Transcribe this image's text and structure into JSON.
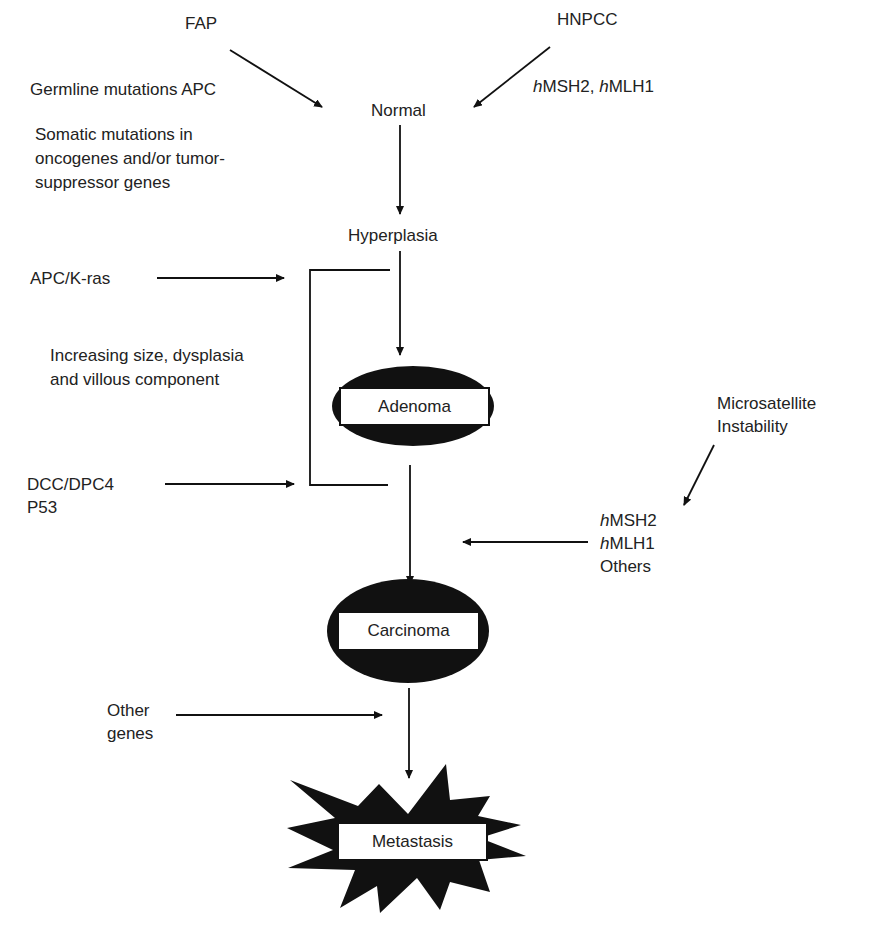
{
  "diagram": {
    "type": "pathway-flowchart",
    "stages": [
      {
        "id": "normal",
        "label": "Normal"
      },
      {
        "id": "hyperplasia",
        "label": "Hyperplasia"
      },
      {
        "id": "adenoma",
        "label": "Adenoma"
      },
      {
        "id": "carcinoma",
        "label": "Carcinoma"
      },
      {
        "id": "metastasis",
        "label": "Metastasis"
      }
    ],
    "inputs": {
      "fap": "FAP",
      "hnpcc": "HNPCC",
      "hnpcc_genes": {
        "prefix1": "h",
        "gene1": "MSH2, ",
        "prefix2": "h",
        "gene2": "MLH1"
      },
      "germline": "Germline mutations APC",
      "somatic": [
        "Somatic mutations in",
        "oncogenes and/or tumor-",
        "suppressor genes"
      ],
      "apc_kras": "APC/K-ras",
      "increasing": [
        "Increasing size, dysplasia",
        "and villous component"
      ],
      "dcc": [
        "DCC/DPC4",
        "P53"
      ],
      "msi": [
        "Microsatellite",
        "Instability"
      ],
      "msi_genes": [
        {
          "prefix": "h",
          "gene": "MSH2"
        },
        {
          "prefix": "h",
          "gene": "MLH1"
        },
        {
          "prefix": "",
          "gene": "Others"
        }
      ],
      "other_genes": [
        "Other",
        "genes"
      ]
    },
    "colors": {
      "ink": "#111111",
      "background": "#ffffff"
    }
  }
}
